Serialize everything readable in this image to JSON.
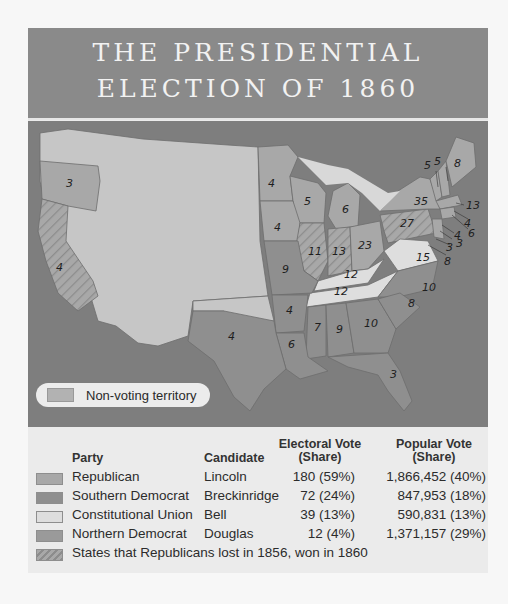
{
  "title": {
    "line1": "THE PRESIDENTIAL",
    "line2": "ELECTION OF 1860"
  },
  "map": {
    "non_voting_legend": "Non-voting territory",
    "state_labels": [
      {
        "state": "Oregon",
        "ev": "3"
      },
      {
        "state": "California",
        "ev": "4"
      },
      {
        "state": "Minnesota",
        "ev": "4"
      },
      {
        "state": "Wisconsin",
        "ev": "5"
      },
      {
        "state": "Michigan",
        "ev": "6"
      },
      {
        "state": "Iowa",
        "ev": "4"
      },
      {
        "state": "Illinois",
        "ev": "11"
      },
      {
        "state": "Indiana",
        "ev": "13"
      },
      {
        "state": "Ohio",
        "ev": "23"
      },
      {
        "state": "Pennsylvania",
        "ev": "27"
      },
      {
        "state": "New York",
        "ev": "35"
      },
      {
        "state": "Vermont",
        "ev": "5"
      },
      {
        "state": "New Hampshire",
        "ev": "5"
      },
      {
        "state": "Maine",
        "ev": "8"
      },
      {
        "state": "Massachusetts",
        "ev": "13"
      },
      {
        "state": "Rhode Island",
        "ev": "4"
      },
      {
        "state": "Connecticut",
        "ev": "6"
      },
      {
        "state": "New Jersey",
        "ev": "4"
      },
      {
        "state": "Delaware",
        "ev": "3"
      },
      {
        "state": "Maryland",
        "ev": "3"
      },
      {
        "state": "Virginia",
        "ev": "15"
      },
      {
        "state": "Maryland-callout",
        "ev": "8"
      },
      {
        "state": "Missouri",
        "ev": "9"
      },
      {
        "state": "Kentucky",
        "ev": "12"
      },
      {
        "state": "Tennessee",
        "ev": "12"
      },
      {
        "state": "North Carolina",
        "ev": "10"
      },
      {
        "state": "South Carolina",
        "ev": "8"
      },
      {
        "state": "Arkansas",
        "ev": "4"
      },
      {
        "state": "Mississippi",
        "ev": "7"
      },
      {
        "state": "Alabama",
        "ev": "9"
      },
      {
        "state": "Georgia",
        "ev": "10"
      },
      {
        "state": "Louisiana",
        "ev": "6"
      },
      {
        "state": "Texas",
        "ev": "4"
      },
      {
        "state": "Florida",
        "ev": "3"
      }
    ]
  },
  "legend": {
    "headers": {
      "party": "Party",
      "candidate": "Candidate",
      "electoral_line1": "Electoral Vote",
      "electoral_line2": "(Share)",
      "popular_line1": "Popular Vote",
      "popular_line2": "(Share)"
    },
    "rows": [
      {
        "party": "Republican",
        "candidate": "Lincoln",
        "electoral": "180 (59%)",
        "popular": "1,866,452 (40%)",
        "color": "#a8a8a8"
      },
      {
        "party": "Southern Democrat",
        "candidate": "Breckinridge",
        "electoral": "72 (24%)",
        "popular": "847,953 (18%)",
        "color": "#8f8f8f"
      },
      {
        "party": "Constitutional Union",
        "candidate": "Bell",
        "electoral": "39 (13%)",
        "popular": "590,831 (13%)",
        "color": "#dedede"
      },
      {
        "party": "Northern Democrat",
        "candidate": "Douglas",
        "electoral": "12 (4%)",
        "popular": "1,371,157 (29%)",
        "color": "#9a9a9a"
      }
    ],
    "hatched_note": "States that Republicans lost in 1856, won in 1860"
  },
  "colors": {
    "title_band": "#8a8a8a",
    "ocean": "#7e7e7e",
    "non_voting": "#c6c6c6",
    "republican": "#a8a8a8",
    "southern_democrat": "#8f8f8f",
    "constitutional_union": "#dedede",
    "legend_bg": "#ebebeb"
  }
}
